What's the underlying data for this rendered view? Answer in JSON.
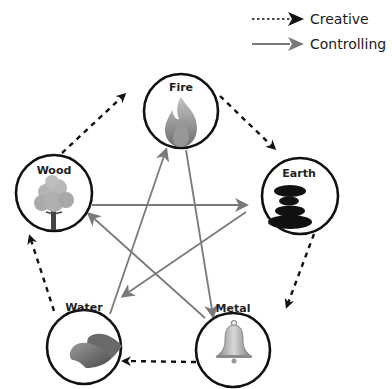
{
  "legend": {
    "creative": {
      "label": "Creative",
      "style": "dashed",
      "color": "#111111"
    },
    "controlling": {
      "label": "Controlling",
      "style": "solid",
      "color": "#7a7a7a"
    }
  },
  "elements": [
    {
      "id": "fire",
      "label": "Fire",
      "icon": "flame-icon"
    },
    {
      "id": "earth",
      "label": "Earth",
      "icon": "stacked-stones-icon"
    },
    {
      "id": "metal",
      "label": "Metal",
      "icon": "bell-icon"
    },
    {
      "id": "water",
      "label": "Water",
      "icon": "wave-icon"
    },
    {
      "id": "wood",
      "label": "Wood",
      "icon": "tree-icon"
    }
  ],
  "creative_cycle": [
    {
      "from": "Fire",
      "to": "Earth"
    },
    {
      "from": "Earth",
      "to": "Metal"
    },
    {
      "from": "Metal",
      "to": "Water"
    },
    {
      "from": "Water",
      "to": "Wood"
    },
    {
      "from": "Wood",
      "to": "Fire"
    }
  ],
  "controlling_cycle": [
    {
      "from": "Water",
      "to": "Fire"
    },
    {
      "from": "Fire",
      "to": "Metal"
    },
    {
      "from": "Metal",
      "to": "Wood"
    },
    {
      "from": "Wood",
      "to": "Earth"
    },
    {
      "from": "Earth",
      "to": "Water"
    }
  ],
  "colors": {
    "circle_stroke": "#111111",
    "controlling_arrow": "#7a7a7a",
    "creative_arrow": "#111111"
  }
}
